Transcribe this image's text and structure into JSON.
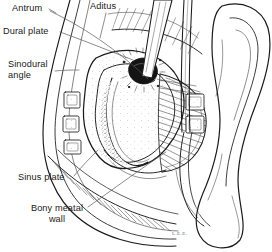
{
  "figure": {
    "kind": "anatomical-line-drawing",
    "style": "black-and-white pen-and-ink stipple / hatch illustration",
    "background_color": "#ffffff",
    "ink_color": "#1a1a1a",
    "leader_color": "#55555a"
  },
  "labels": [
    {
      "id": "antrum",
      "text": "Antrum",
      "x": 12,
      "y": 4,
      "align": "left"
    },
    {
      "id": "aditus",
      "text": "Aditus",
      "x": 90,
      "y": 2,
      "align": "left"
    },
    {
      "id": "dural_plate",
      "text": "Dural plate",
      "x": 4,
      "y": 27,
      "align": "left"
    },
    {
      "id": "sinodural_angle",
      "text": "Sinodural\nangle",
      "x": 8,
      "y": 60,
      "align": "left"
    },
    {
      "id": "sinus_plate",
      "text": "Sinus plate",
      "x": 19,
      "y": 177,
      "align": "left"
    },
    {
      "id": "bony_meatal_wall",
      "text": "Bony meatal\nwall",
      "x": 30,
      "y": 208,
      "align": "center"
    }
  ],
  "signature": {
    "text": "L.E.E.",
    "x": 172,
    "y": 233
  },
  "leaders": [
    {
      "from": "antrum",
      "to_point": [
        148,
        79
      ]
    },
    {
      "from": "aditus",
      "to_point": [
        100,
        38
      ]
    },
    {
      "from": "dural_plate",
      "to_point": [
        133,
        60
      ]
    },
    {
      "from": "sinodural_angle",
      "to_point": [
        79,
        70
      ]
    },
    {
      "from": "sinus_plate",
      "to_point": [
        98,
        150
      ]
    },
    {
      "from": "bony_meatal_wall",
      "to_point": [
        166,
        152
      ]
    }
  ]
}
